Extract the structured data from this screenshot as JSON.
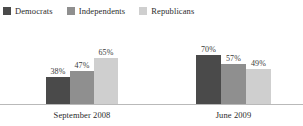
{
  "chart_data": {
    "type": "bar",
    "title": "",
    "subtitle": "",
    "xlabel": "",
    "ylabel": "",
    "ylim": [
      0,
      100
    ],
    "grid": false,
    "legend_position": "top-left",
    "value_suffix": "%",
    "categories": [
      "September 2008",
      "June 2009"
    ],
    "series": [
      {
        "name": "Democrats",
        "color": "#4a4a4a",
        "values": [
          38,
          70
        ],
        "labels": [
          "38%",
          "70%"
        ]
      },
      {
        "name": "Independents",
        "color": "#8f8f8f",
        "values": [
          47,
          57
        ],
        "labels": [
          "47%",
          "57%"
        ]
      },
      {
        "name": "Republicans",
        "color": "#cfcfcf",
        "values": [
          65,
          49
        ],
        "labels": [
          "65%",
          "49%"
        ]
      }
    ]
  },
  "legend": {
    "items": [
      {
        "label": "Democrats",
        "color": "#4a4a4a"
      },
      {
        "label": "Independents",
        "color": "#8f8f8f"
      },
      {
        "label": "Republicans",
        "color": "#cfcfcf"
      }
    ]
  },
  "axis": {
    "baseline_color": "#b9b9b9"
  }
}
